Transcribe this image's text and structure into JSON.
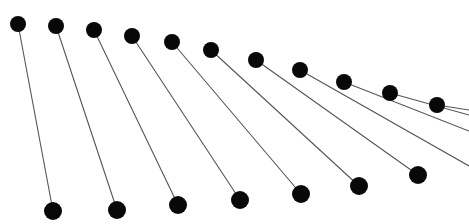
{
  "figure": {
    "background_color": "#ffffff",
    "width": 469,
    "height": 224,
    "rod_color": "#555555",
    "rod_width": 1.1,
    "bob_color": "#080808"
  },
  "chart_data": {
    "type": "scatter",
    "subtitle": "",
    "xlabel": "",
    "ylabel": "",
    "xlim": [
      0,
      469
    ],
    "ylim": [
      224,
      0
    ],
    "grid": false,
    "legend": null,
    "annotations": [],
    "tick_labels": {
      "x": [],
      "y": []
    },
    "series": [
      {
        "name": "pivots",
        "marker": "circle",
        "marker_radius": 8,
        "color": "#080808",
        "x": [
          18,
          56,
          94,
          132,
          172,
          211,
          256,
          300,
          344,
          390,
          437
        ],
        "y": [
          24,
          26,
          30,
          36,
          42,
          50,
          60,
          70,
          82,
          93,
          105
        ]
      },
      {
        "name": "bobs",
        "marker": "circle",
        "marker_radius": 9,
        "color": "#080808",
        "x": [
          53,
          117,
          178,
          240,
          301,
          359,
          418
        ],
        "y": [
          211,
          210,
          205,
          200,
          194,
          186,
          175
        ]
      }
    ],
    "rods": [
      {
        "index": 1,
        "x1": 18,
        "y1": 24,
        "x2": 53,
        "y2": 211,
        "bob_visible": true,
        "length": 190.2,
        "angle_deg": 10.6
      },
      {
        "index": 2,
        "x1": 56,
        "y1": 26,
        "x2": 117,
        "y2": 210,
        "bob_visible": true,
        "length": 193.8,
        "angle_deg": 18.3
      },
      {
        "index": 3,
        "x1": 94,
        "y1": 30,
        "x2": 178,
        "y2": 205,
        "bob_visible": true,
        "length": 194.1,
        "angle_deg": 25.6
      },
      {
        "index": 4,
        "x1": 132,
        "y1": 36,
        "x2": 240,
        "y2": 200,
        "bob_visible": true,
        "length": 196.3,
        "angle_deg": 33.4
      },
      {
        "index": 5,
        "x1": 172,
        "y1": 42,
        "x2": 301,
        "y2": 194,
        "bob_visible": true,
        "length": 198.4,
        "angle_deg": 40.3
      },
      {
        "index": 6,
        "x1": 211,
        "y1": 50,
        "x2": 359,
        "y2": 186,
        "bob_visible": true,
        "length": 200.9,
        "angle_deg": 47.5
      },
      {
        "index": 7,
        "x1": 256,
        "y1": 60,
        "x2": 418,
        "y2": 175,
        "bob_visible": true,
        "length": 198.7,
        "angle_deg": 54.7
      },
      {
        "index": 8,
        "x1": 300,
        "y1": 70,
        "x2": 469,
        "y2": 166,
        "bob_visible": false,
        "length": 194.3,
        "angle_deg": 60.4
      },
      {
        "index": 9,
        "x1": 344,
        "y1": 82,
        "x2": 469,
        "y2": 131,
        "bob_visible": false,
        "length": 134.3,
        "angle_deg": 68.6
      },
      {
        "index": 10,
        "x1": 390,
        "y1": 93,
        "x2": 469,
        "y2": 115,
        "bob_visible": false,
        "length": 82.0,
        "angle_deg": 74.4
      },
      {
        "index": 11,
        "x1": 437,
        "y1": 105,
        "x2": 469,
        "y2": 110,
        "bob_visible": false,
        "length": 32.4,
        "angle_deg": 81.1
      }
    ]
  }
}
